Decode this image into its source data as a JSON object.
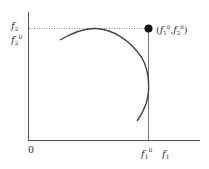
{
  "diagram": {
    "y_axis_label": "f",
    "y_axis_sub": "2",
    "y_tick_label": "f",
    "y_tick_sub": "2",
    "y_tick_sup": "0",
    "x_axis_label": "f",
    "x_axis_sub": "1",
    "x_tick_label": "f",
    "x_tick_sub": "1",
    "x_tick_sup": "0",
    "origin_label": "0",
    "point_label_open": "(",
    "point_f1": "f",
    "point_f1_sub": "1",
    "point_f1_sup": "0",
    "point_sep": ",",
    "point_f2": "f",
    "point_f2_sub": "2",
    "point_f2_sup": "0",
    "point_label_close": ")",
    "colors": {
      "line": "#444444",
      "point": "#111111",
      "dotted": "#777777"
    }
  }
}
